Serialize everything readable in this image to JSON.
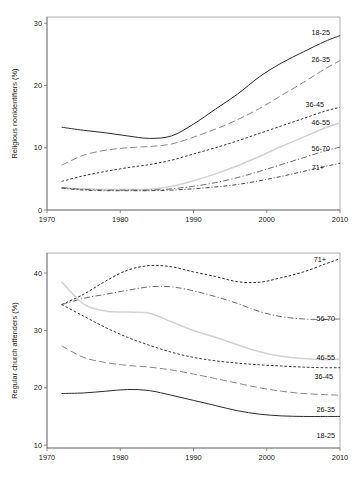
{
  "figure": {
    "background": "#ffffff",
    "panel_count": 2
  },
  "chart_data": [
    {
      "id": "religious-nonidentifiers",
      "type": "line",
      "title": "",
      "xlabel": "",
      "ylabel": "Religious nonidentifiers (%)",
      "xlim": [
        1970,
        2010
      ],
      "ylim": [
        0,
        31
      ],
      "xticks": [
        1970,
        1980,
        1990,
        2000,
        2010
      ],
      "yticks": [
        0,
        10,
        20,
        30
      ],
      "xtick_labels": [
        "1970",
        "1980",
        "1990",
        "2000",
        "2010"
      ],
      "ytick_labels": [
        "0",
        "10",
        "20",
        "30"
      ],
      "grid": false,
      "legend_position": "right-inline-labels",
      "x": [
        1972,
        1975,
        1978,
        1981,
        1984,
        1987,
        1990,
        1993,
        1996,
        1999,
        2002,
        2005,
        2008,
        2010
      ],
      "series": [
        {
          "name": "18-25",
          "label": "18-25",
          "style": "solid",
          "color": "#2b2b2b",
          "values": [
            13.3,
            12.8,
            12.4,
            11.9,
            11.5,
            11.9,
            13.8,
            16.2,
            18.6,
            21.4,
            23.6,
            25.4,
            27.1,
            28.0
          ]
        },
        {
          "name": "26-35",
          "label": "26-35",
          "style": "long-dash",
          "color": "#8a8a8a",
          "values": [
            7.2,
            8.8,
            9.6,
            10.0,
            10.2,
            10.6,
            11.7,
            13.0,
            14.5,
            16.3,
            18.4,
            20.5,
            22.7,
            24.0
          ]
        },
        {
          "name": "36-45",
          "label": "36-45",
          "style": "short-dash",
          "color": "#3a3a3a",
          "values": [
            4.6,
            5.5,
            6.2,
            6.8,
            7.3,
            8.0,
            9.0,
            10.0,
            11.1,
            12.3,
            13.5,
            14.7,
            15.9,
            16.5
          ]
        },
        {
          "name": "46-55",
          "label": "46-55",
          "style": "solid",
          "color": "#d2d2d2",
          "values": [
            3.6,
            3.4,
            3.3,
            3.3,
            3.3,
            3.8,
            4.7,
            5.8,
            7.1,
            8.6,
            10.2,
            11.7,
            13.2,
            14.0
          ]
        },
        {
          "name": "56-70",
          "label": "56-70",
          "style": "dash-dot",
          "color": "#6d6d6d",
          "values": [
            3.6,
            3.3,
            3.2,
            3.2,
            3.2,
            3.4,
            3.8,
            4.4,
            5.2,
            6.2,
            7.3,
            8.4,
            9.5,
            10.1
          ]
        },
        {
          "name": "71+",
          "label": "71+",
          "style": "dash-dot-short",
          "color": "#4a4a4a",
          "values": [
            3.5,
            3.2,
            3.1,
            3.1,
            3.1,
            3.2,
            3.4,
            3.7,
            4.1,
            4.7,
            5.4,
            6.2,
            7.0,
            7.5
          ]
        }
      ]
    },
    {
      "id": "regular-church-attenders",
      "type": "line",
      "title": "",
      "xlabel": "",
      "ylabel": "Regular church attenders (%)",
      "xlim": [
        1970,
        2010
      ],
      "ylim": [
        9.5,
        43.5
      ],
      "xticks": [
        1970,
        1980,
        1990,
        2000,
        2010
      ],
      "yticks": [
        10,
        20,
        30,
        40
      ],
      "xtick_labels": [
        "1970",
        "1980",
        "1990",
        "2000",
        "2010"
      ],
      "ytick_labels": [
        "10",
        "20",
        "30",
        "40"
      ],
      "grid": false,
      "legend_position": "right-inline-labels",
      "x": [
        1972,
        1975,
        1978,
        1981,
        1984,
        1987,
        1990,
        1993,
        1996,
        1999,
        2002,
        2005,
        2008,
        2010
      ],
      "series": [
        {
          "name": "71+",
          "label": "71+",
          "style": "short-dash",
          "color": "#2f2f2f",
          "values": [
            34.5,
            36.3,
            38.6,
            40.5,
            41.3,
            41.1,
            40.2,
            39.4,
            38.5,
            38.4,
            39.2,
            40.2,
            41.6,
            42.5
          ]
        },
        {
          "name": "56-70",
          "label": "56-70",
          "style": "dash-dot",
          "color": "#6d6d6d",
          "values": [
            34.5,
            35.6,
            36.3,
            37.0,
            37.6,
            37.6,
            36.9,
            35.9,
            34.7,
            33.3,
            32.4,
            32.0,
            31.9,
            32.0
          ]
        },
        {
          "name": "46-55",
          "label": "46-55",
          "style": "solid",
          "color": "#d2d2d2",
          "values": [
            38.5,
            34.6,
            33.4,
            33.2,
            33.0,
            31.5,
            30.0,
            28.8,
            27.5,
            26.3,
            25.5,
            25.1,
            24.9,
            25.0
          ]
        },
        {
          "name": "36-45",
          "label": "36-45",
          "style": "short-dash",
          "color": "#3a3a3a",
          "values": [
            34.5,
            32.5,
            30.5,
            28.8,
            27.4,
            26.2,
            25.3,
            24.7,
            24.3,
            24.0,
            23.8,
            23.6,
            23.5,
            23.5
          ]
        },
        {
          "name": "26-35",
          "label": "26-35",
          "style": "long-dash",
          "color": "#8a8a8a",
          "values": [
            27.3,
            25.3,
            24.4,
            23.9,
            23.6,
            23.1,
            22.4,
            21.6,
            20.8,
            20.0,
            19.4,
            19.0,
            18.8,
            18.7
          ]
        },
        {
          "name": "18-25",
          "label": "18-25",
          "style": "solid",
          "color": "#2b2b2b",
          "values": [
            19.0,
            19.1,
            19.4,
            19.7,
            19.5,
            18.7,
            17.8,
            16.9,
            16.0,
            15.4,
            15.1,
            15.0,
            15.0,
            15.0
          ]
        }
      ]
    }
  ]
}
